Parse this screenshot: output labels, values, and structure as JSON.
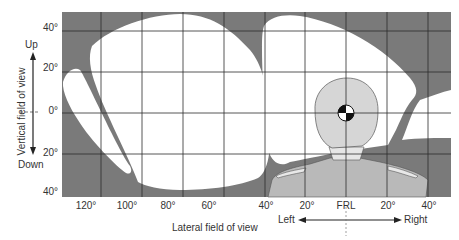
{
  "figure": {
    "vertical_axis": {
      "title": "Vertical field of view",
      "up_label": "Up",
      "down_label": "Down",
      "ticks": [
        "40°",
        "20°",
        "0°",
        "20°",
        "40°"
      ]
    },
    "lateral_axis": {
      "title": "Lateral field of view",
      "ticks": [
        "120°",
        "100°",
        "80°",
        "60°",
        "40°",
        "20°",
        "FRL",
        "20°",
        "40°"
      ],
      "left_label": "Left",
      "right_label": "Right"
    },
    "colors": {
      "obstruction": "#7a7a7a",
      "visible_area": "#ffffff",
      "occupant": "#b9b9b9",
      "head": "#d6d6d6",
      "grid": "#2b2b2b"
    }
  }
}
